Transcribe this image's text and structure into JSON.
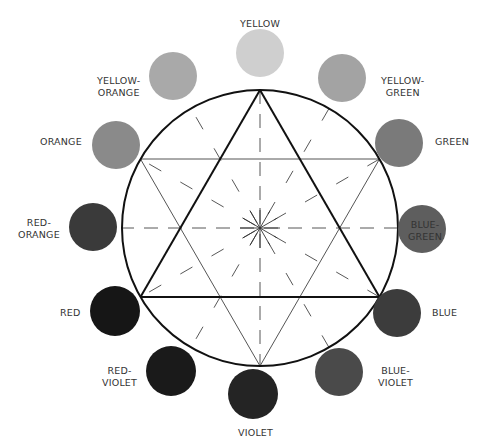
{
  "diagram": {
    "type": "color-wheel",
    "wheel": {
      "cx": 260,
      "cy": 228,
      "r": 138
    },
    "swatches": [
      {
        "id": "yellow",
        "label": "YELLOW",
        "cx": 260,
        "cy": 53,
        "r": 24,
        "fill": "#cfcfcf"
      },
      {
        "id": "yellow-orange",
        "label": "YELLOW-\nORANGE",
        "cx": 173,
        "cy": 76,
        "r": 24,
        "fill": "#a9a9a9"
      },
      {
        "id": "orange",
        "label": "ORANGE",
        "cx": 116,
        "cy": 145,
        "r": 24,
        "fill": "#8a8a8a"
      },
      {
        "id": "red-orange",
        "label": "RED-\nORANGE",
        "cx": 93,
        "cy": 227,
        "r": 24,
        "fill": "#3a3a3a"
      },
      {
        "id": "red",
        "label": "RED",
        "cx": 115,
        "cy": 311,
        "r": 25,
        "fill": "#161616"
      },
      {
        "id": "red-violet",
        "label": "RED-\nVIOLET",
        "cx": 171,
        "cy": 371,
        "r": 25,
        "fill": "#1a1a1a"
      },
      {
        "id": "violet",
        "label": "VIOLET",
        "cx": 253,
        "cy": 394,
        "r": 25,
        "fill": "#242424"
      },
      {
        "id": "blue-violet",
        "label": "BLUE-\nVIOLET",
        "cx": 339,
        "cy": 372,
        "r": 24,
        "fill": "#4a4a4a"
      },
      {
        "id": "blue",
        "label": "BLUE",
        "cx": 397,
        "cy": 313,
        "r": 24,
        "fill": "#3c3c3c"
      },
      {
        "id": "blue-green",
        "label": "BLUE-\nGREEN",
        "cx": 422,
        "cy": 229,
        "r": 24,
        "fill": "#5e5e5e"
      },
      {
        "id": "green",
        "label": "GREEN",
        "cx": 399,
        "cy": 143,
        "r": 24,
        "fill": "#7a7a7a"
      },
      {
        "id": "yellow-green",
        "label": "YELLOW-\nGREEN",
        "cx": 342,
        "cy": 78,
        "r": 24,
        "fill": "#a3a3a3"
      }
    ],
    "labels": [
      {
        "id": "yellow",
        "text": "YELLOW",
        "x": 240,
        "y": 18
      },
      {
        "id": "yellow-orange",
        "text": "YELLOW-\nORANGE",
        "x": 97,
        "y": 75
      },
      {
        "id": "orange",
        "text": "ORANGE",
        "x": 40,
        "y": 136
      },
      {
        "id": "red-orange",
        "text": "RED-\nORANGE",
        "x": 18,
        "y": 217
      },
      {
        "id": "red",
        "text": "RED",
        "x": 60,
        "y": 307
      },
      {
        "id": "red-violet",
        "text": "RED-\nVIOLET",
        "x": 102,
        "y": 365
      },
      {
        "id": "violet",
        "text": "VIOLET",
        "x": 238,
        "y": 427
      },
      {
        "id": "blue-violet",
        "text": "BLUE-\nVIOLET",
        "x": 378,
        "y": 365
      },
      {
        "id": "blue",
        "text": "BLUE",
        "x": 432,
        "y": 307
      },
      {
        "id": "blue-green",
        "text": "BLUE-\nGREEN",
        "x": 408,
        "y": 219
      },
      {
        "id": "green",
        "text": "GREEN",
        "x": 435,
        "y": 136
      },
      {
        "id": "yellow-green",
        "text": "YELLOW-\nGREEN",
        "x": 381,
        "y": 75
      }
    ],
    "primary_triangle": [
      "yellow",
      "red",
      "blue"
    ],
    "secondary_triangle": [
      "orange",
      "green",
      "violet"
    ]
  }
}
